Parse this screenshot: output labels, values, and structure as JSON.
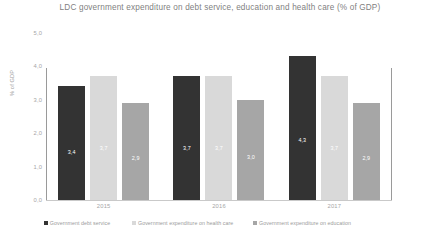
{
  "chart_data": {
    "type": "bar",
    "title": "LDC government expenditure on debt service, education and health care (% of GDP)",
    "xlabel": "",
    "ylabel": "% of GDP",
    "ylim": [
      0,
      5
    ],
    "ytick_step": 1,
    "grid": false,
    "legend_position": "bottom",
    "decimal_separator": ",",
    "categories": [
      "2015",
      "2016",
      "2017"
    ],
    "ytick_labels": [
      "0,0",
      "1,0",
      "2,0",
      "3,0",
      "4,0",
      "5,0"
    ],
    "ytick_values": [
      0,
      1,
      2,
      3,
      4,
      5
    ],
    "series": [
      {
        "name": "Government debt service",
        "color": "#333333",
        "values": [
          3.4,
          3.7,
          4.3
        ],
        "labels": [
          "3,4",
          "3,7",
          "4,3"
        ]
      },
      {
        "name": "Government expenditure on health care",
        "color": "#d9d9d9",
        "values": [
          3.7,
          3.7,
          3.7
        ],
        "labels": [
          "3,7",
          "3,7",
          "3,7"
        ]
      },
      {
        "name": "Government expenditure on education",
        "color": "#a6a6a6",
        "values": [
          2.9,
          3.0,
          2.9
        ],
        "labels": [
          "2,9",
          "3,0",
          "2,9"
        ]
      }
    ]
  }
}
